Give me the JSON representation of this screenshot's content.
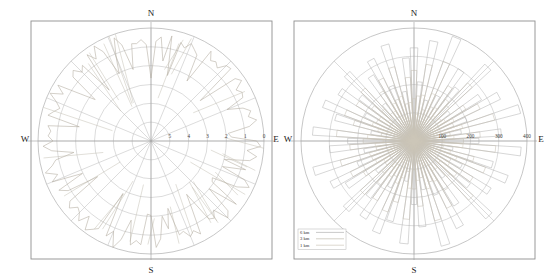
{
  "figure": {
    "background": "#ffffff",
    "panel_count": 2,
    "frame_color": "#8a8a8a",
    "grid_color": "#b9b9b9",
    "axis_color": "#9a9a9a"
  },
  "chart_data": [
    {
      "id": "left-rose",
      "type": "line",
      "subtype": "polar-rose-diagram",
      "title": "",
      "xlabel": "",
      "ylabel": "",
      "grid": true,
      "legend": null,
      "cardinals": {
        "north": "N",
        "east": "E",
        "south": "S",
        "west": "W"
      },
      "radial_axis": {
        "labels": [
          "5",
          "4",
          "3",
          "2",
          "1",
          "0"
        ],
        "label_order": "center-to-edge",
        "ring_count": 6,
        "rmin": 5,
        "rmax": 0
      },
      "angular_axis": {
        "spoke_count": 16,
        "spoke_step_deg": 22.5
      },
      "series": [
        {
          "name": "profile",
          "color": "#b0a99c",
          "values": [
            0.62,
            0.55,
            0.71,
            0.49,
            0.8,
            0.58,
            0.66,
            0.52,
            0.74,
            0.6,
            0.47,
            0.69,
            0.83,
            0.56,
            0.64,
            0.51,
            0.78,
            0.59,
            0.45,
            0.72,
            0.86,
            0.53,
            0.67,
            0.61,
            0.76,
            0.48,
            0.7,
            0.57,
            0.82,
            0.54,
            0.63,
            0.5,
            0.75,
            0.66,
            0.44,
            0.79,
            0.58,
            0.68,
            0.52,
            0.73,
            0.6,
            0.85,
            0.47,
            0.65,
            0.56,
            0.77,
            0.51,
            0.69,
            0.62,
            0.81,
            0.55,
            0.46,
            0.71,
            0.59,
            0.74,
            0.53,
            0.67,
            0.84,
            0.49,
            0.72,
            0.57,
            0.64,
            0.5,
            0.78,
            0.61,
            0.45,
            0.7,
            0.58,
            0.76,
            0.52,
            0.66,
            0.8,
            0.48,
            0.73,
            0.56,
            0.63,
            0.54,
            0.69,
            0.47,
            0.82,
            0.6,
            0.51,
            0.75,
            0.59,
            0.65,
            0.44,
            0.71,
            0.57,
            0.79,
            0.53,
            0.68,
            0.62,
            0.46,
            0.74,
            0.55,
            0.83,
            0.49,
            0.66,
            0.58,
            0.7,
            0.52,
            0.77,
            0.61,
            0.45,
            0.64,
            0.72,
            0.54,
            0.85,
            0.5,
            0.67,
            0.59,
            0.73,
            0.47,
            0.63,
            0.56,
            0.81,
            0.51,
            0.69,
            0.6,
            0.75,
            0.48,
            0.65,
            0.57,
            0.78,
            0.53,
            0.71,
            0.62,
            0.44
          ]
        }
      ]
    },
    {
      "id": "right-rose",
      "type": "bar",
      "subtype": "polar-rose-diagram",
      "title": "",
      "xlabel": "",
      "ylabel": "",
      "grid": true,
      "cardinals": {
        "north": "N",
        "east": "E",
        "south": "S",
        "west": "W"
      },
      "radial_axis": {
        "labels": [
          "100",
          "200",
          "300",
          "400"
        ],
        "label_order": "center-to-edge",
        "ring_count": 4,
        "rmin": 0,
        "rmax": 400,
        "tick_values": [
          100,
          200,
          300,
          400
        ]
      },
      "angular_axis": {
        "spoke_count": 8,
        "spoke_step_deg": 45
      },
      "legend": {
        "position": "bottom-left",
        "entries": [
          {
            "label": "6 km",
            "color": "#b3b3b3"
          },
          {
            "label": "3 km",
            "color": "#c2bdb0"
          },
          {
            "label": "1 km",
            "color": "#cfc9bb"
          }
        ]
      },
      "series": [
        {
          "name": "6 km",
          "color": "#aeaeae",
          "values": [
            330,
            210,
            360,
            150,
            395,
            180,
            300,
            240,
            370,
            160,
            280,
            340,
            200,
            390,
            170,
            310,
            230,
            380,
            140,
            290,
            355,
            190,
            320,
            250,
            375,
            165,
            270,
            345,
            205,
            385,
            175,
            305,
            225,
            365,
            145,
            295,
            350,
            185,
            325,
            255,
            340,
            170,
            285,
            330,
            215,
            370,
            180,
            300,
            235,
            360,
            155,
            290,
            345,
            195,
            315,
            245,
            335,
            168,
            275,
            325,
            210,
            355,
            178,
            295
          ]
        },
        {
          "name": "3 km",
          "color": "#c0bbae",
          "values": [
            250,
            160,
            275,
            115,
            300,
            135,
            230,
            185,
            280,
            120,
            215,
            260,
            150,
            295,
            130,
            235,
            175,
            290,
            105,
            220,
            270,
            145,
            245,
            190,
            285,
            125,
            205,
            265,
            155,
            292,
            132,
            232,
            170,
            278,
            110,
            225,
            268,
            140,
            248,
            195,
            258,
            128,
            210,
            250,
            160,
            270,
            136,
            228,
            180,
            275,
            118,
            222,
            262,
            148,
            240,
            188,
            255,
            126,
            208,
            248,
            158,
            272,
            134,
            226
          ]
        },
        {
          "name": "1 km",
          "color": "#cdc7b9",
          "values": [
            150,
            95,
            165,
            70,
            180,
            82,
            140,
            112,
            170,
            74,
            130,
            158,
            92,
            178,
            80,
            142,
            106,
            174,
            64,
            134,
            162,
            88,
            148,
            116,
            172,
            76,
            124,
            160,
            94,
            176,
            81,
            140,
            103,
            168,
            68,
            136,
            161,
            85,
            150,
            118,
            155,
            78,
            126,
            152,
            97,
            163,
            83,
            138,
            109,
            165,
            72,
            133,
            158,
            90,
            145,
            114,
            154,
            77,
            125,
            150,
            96,
            164,
            82,
            137
          ]
        }
      ]
    }
  ]
}
